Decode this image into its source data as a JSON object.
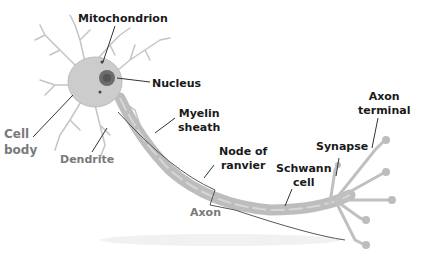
{
  "diagram": {
    "colors": {
      "label_dark": "#1a1a1a",
      "label_gray": "#7a7a7a",
      "cell_fill": "#c9c9c9",
      "myelin_fill": "#b8b8b8",
      "nucleus_fill": "#6e6e6e",
      "leader_line": "#333333",
      "dendrite_stroke": "#bdbdbd"
    },
    "labels": {
      "mitochondrion": "Mitochondrion",
      "nucleus": "Nucleus",
      "cell_body": "Cell\nbody",
      "dendrite": "Dendrite",
      "myelin_sheath": "Myelin\nsheath",
      "node_of_ranvier": "Node of\nranvier",
      "axon": "Axon",
      "schwann_cell": "Schwann\ncell",
      "synapse": "Synapse",
      "axon_terminal": "Axon\nterminal"
    }
  }
}
